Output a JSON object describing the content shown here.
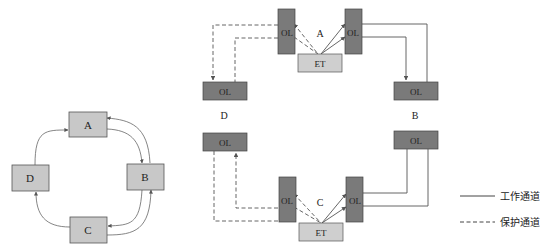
{
  "left_ring": {
    "nodes": [
      {
        "id": "A",
        "label": "A"
      },
      {
        "id": "B",
        "label": "B"
      },
      {
        "id": "C",
        "label": "C"
      },
      {
        "id": "D",
        "label": "D"
      }
    ]
  },
  "right_network": {
    "node_A": {
      "label": "A",
      "ol_left": "OL",
      "ol_right": "OL",
      "et": "ET"
    },
    "node_C": {
      "label": "C",
      "ol_left": "OL",
      "ol_right": "OL",
      "et": "ET"
    },
    "node_D": {
      "label": "D",
      "ol_top": "OL",
      "ol_bottom": "OL"
    },
    "node_B": {
      "label": "B",
      "ol_top": "OL",
      "ol_bottom": "OL"
    }
  },
  "legend": {
    "working": "工作通道",
    "protection": "保护通道"
  },
  "colors": {
    "ol_box": "#7a7a7a",
    "et_box": "#cfcfcf",
    "node_box": "#c8c8c8",
    "line": "#555555"
  }
}
